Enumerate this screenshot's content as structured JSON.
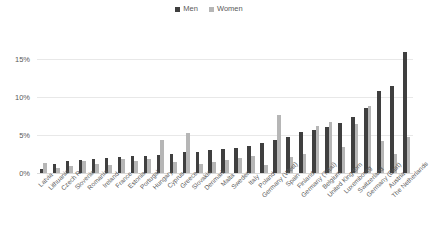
{
  "chart_data": {
    "type": "bar",
    "title": "",
    "subtitle": "",
    "xlabel": "",
    "ylabel": "",
    "ylim": [
      0,
      17.5
    ],
    "yticks": [
      0,
      5,
      10,
      15
    ],
    "ytick_labels": [
      "0%",
      "5%",
      "10%",
      "15%"
    ],
    "grid": true,
    "legend_position": "top-center",
    "categories": [
      "Latvia",
      "Lithuania",
      "Czech R.",
      "Slovenia",
      "Romania",
      "Ireland",
      "France",
      "Estonia",
      "Portugal",
      "Hungary",
      "Cyprus",
      "Greece",
      "Slovakia",
      "Denmark",
      "Malta",
      "Sweden",
      "Italy",
      "Poland",
      "Germany (West)",
      "Spain",
      "Finland",
      "Germany (Total)",
      "Belgium",
      "United Kingdom",
      "Luxembourg",
      "Switzerland",
      "Germany (East)",
      "Austria",
      "The Netherlands"
    ],
    "series": [
      {
        "name": "Men",
        "color": "#3f3f3f",
        "values": [
          0.5,
          1.2,
          1.6,
          1.7,
          1.8,
          2.0,
          2.1,
          2.2,
          2.3,
          2.4,
          2.5,
          2.7,
          2.8,
          3.0,
          3.1,
          3.3,
          3.6,
          4.0,
          4.3,
          4.8,
          5.4,
          5.7,
          6.0,
          6.6,
          7.4,
          8.5,
          10.8,
          11.5,
          15.9
        ]
      },
      {
        "name": "Women",
        "color": "#b6b6b6",
        "values": [
          1.3,
          0.7,
          0.9,
          1.6,
          1.2,
          1.0,
          1.8,
          1.6,
          1.9,
          4.3,
          1.4,
          5.2,
          1.2,
          1.5,
          1.7,
          2.0,
          2.3,
          1.1,
          7.6,
          2.1,
          2.5,
          6.2,
          6.7,
          3.4,
          6.5,
          8.8,
          4.2,
          2.5,
          4.8
        ]
      }
    ]
  },
  "legend": {
    "entries": [
      {
        "label": "Men",
        "color": "#3f3f3f"
      },
      {
        "label": "Women",
        "color": "#b6b6b6"
      }
    ]
  }
}
